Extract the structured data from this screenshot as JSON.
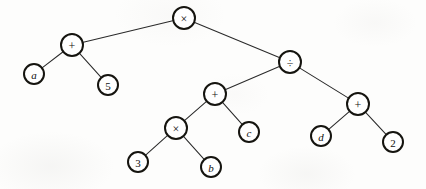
{
  "figure": {
    "expression": "(a + 5) × (((3 × b) + c) ÷ (d + 2))",
    "background_color": "#fdfdfc",
    "node_stroke_color": "#15140f",
    "node_fill_color": "#ffffff",
    "edge_color": "#2a2a2a",
    "label_color": "#111111",
    "width": 426,
    "height": 189
  },
  "nodes": [
    {
      "id": "n1",
      "label": "×",
      "kind": "operator",
      "cx": 184,
      "cy": 18,
      "r": 11.0
    },
    {
      "id": "n2",
      "label": "+",
      "kind": "operator",
      "cx": 72,
      "cy": 45,
      "r": 11.0
    },
    {
      "id": "n3",
      "label": "÷",
      "kind": "operator",
      "cx": 290,
      "cy": 62,
      "r": 11.0
    },
    {
      "id": "n4",
      "label": "a",
      "kind": "variable",
      "cx": 34,
      "cy": 74,
      "r": 10.0
    },
    {
      "id": "n5",
      "label": "5",
      "kind": "number",
      "cx": 108,
      "cy": 85,
      "r": 10.0
    },
    {
      "id": "n6",
      "label": "+",
      "kind": "operator",
      "cx": 215,
      "cy": 94,
      "r": 11.0
    },
    {
      "id": "n7",
      "label": "+",
      "kind": "operator",
      "cx": 358,
      "cy": 104,
      "r": 11.0
    },
    {
      "id": "n8",
      "label": "×",
      "kind": "operator",
      "cx": 176,
      "cy": 128,
      "r": 11.0
    },
    {
      "id": "n9",
      "label": "c",
      "kind": "variable",
      "cx": 249,
      "cy": 132,
      "r": 10.0
    },
    {
      "id": "n10",
      "label": "d",
      "kind": "variable",
      "cx": 321,
      "cy": 136,
      "r": 10.0
    },
    {
      "id": "n11",
      "label": "2",
      "kind": "number",
      "cx": 393,
      "cy": 142,
      "r": 10.0
    },
    {
      "id": "n12",
      "label": "3",
      "kind": "number",
      "cx": 138,
      "cy": 162,
      "r": 10.0
    },
    {
      "id": "n13",
      "label": "b",
      "kind": "variable",
      "cx": 211,
      "cy": 167,
      "r": 10.0
    }
  ],
  "edges": [
    {
      "from": "n1",
      "to": "n2",
      "name": "edge-root-to-plus-left"
    },
    {
      "from": "n1",
      "to": "n3",
      "name": "edge-root-to-divide"
    },
    {
      "from": "n2",
      "to": "n4",
      "name": "edge-plus-left-to-a"
    },
    {
      "from": "n2",
      "to": "n5",
      "name": "edge-plus-left-to-5"
    },
    {
      "from": "n3",
      "to": "n6",
      "name": "edge-divide-to-plus-mid"
    },
    {
      "from": "n3",
      "to": "n7",
      "name": "edge-divide-to-plus-right"
    },
    {
      "from": "n6",
      "to": "n8",
      "name": "edge-plus-mid-to-times"
    },
    {
      "from": "n6",
      "to": "n9",
      "name": "edge-plus-mid-to-c"
    },
    {
      "from": "n7",
      "to": "n10",
      "name": "edge-plus-right-to-d"
    },
    {
      "from": "n7",
      "to": "n11",
      "name": "edge-plus-right-to-2"
    },
    {
      "from": "n8",
      "to": "n12",
      "name": "edge-times-to-3"
    },
    {
      "from": "n8",
      "to": "n13",
      "name": "edge-times-to-b"
    }
  ]
}
